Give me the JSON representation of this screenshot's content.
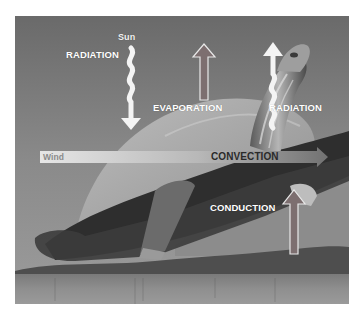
{
  "figure": {
    "labels": {
      "sun": "Sun",
      "radiation_in": "RADIATION",
      "evaporation": "EVAPORATION",
      "radiation_out": "RADIATION",
      "wind": "Wind",
      "convection": "CONVECTION",
      "conduction": "CONDUCTION"
    },
    "arrows": [
      {
        "name": "radiation-in",
        "style": "wavy",
        "direction": "down",
        "color": "#f4f4f4"
      },
      {
        "name": "evaporation",
        "style": "outlined-straight",
        "direction": "up",
        "color": "#7d6f70"
      },
      {
        "name": "radiation-out",
        "style": "wavy",
        "direction": "up",
        "color": "#f4f4f4"
      },
      {
        "name": "convection",
        "style": "gradient-horizontal",
        "direction": "right",
        "color_start": "#e2e2e2",
        "color_end": "#6e6e6e"
      },
      {
        "name": "conduction",
        "style": "outlined-straight",
        "direction": "up",
        "color": "#7d6f70"
      }
    ]
  }
}
